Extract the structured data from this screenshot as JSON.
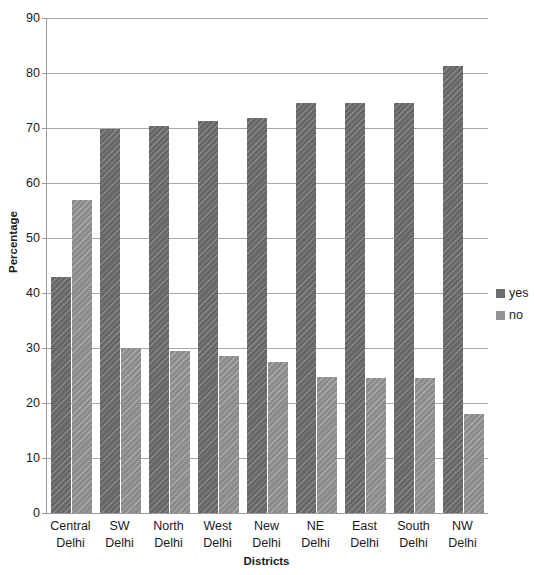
{
  "chart_data": {
    "type": "bar",
    "title": "",
    "xlabel": "Districts",
    "ylabel": "Percentage",
    "categories": [
      "Central Delhi",
      "SW Delhi",
      "North Delhi",
      "West Delhi",
      "New Delhi",
      "NE Delhi",
      "East Delhi",
      "South Delhi",
      "NW Delhi"
    ],
    "category_lines": [
      [
        "Central",
        "Delhi"
      ],
      [
        "SW Delhi",
        ""
      ],
      [
        "North",
        "Delhi"
      ],
      [
        "West",
        "Delhi"
      ],
      [
        "New",
        "Delhi"
      ],
      [
        "NE Delhi",
        ""
      ],
      [
        "East",
        "Delhi"
      ],
      [
        "South",
        "Delhi"
      ],
      [
        "NW Delhi",
        ""
      ]
    ],
    "series": [
      {
        "name": "yes",
        "color": "#6f6f6f",
        "values": [
          43.0,
          69.8,
          70.4,
          71.2,
          71.9,
          74.6,
          74.6,
          74.5,
          81.2
        ]
      },
      {
        "name": "no",
        "color": "#949494",
        "values": [
          57.0,
          30.0,
          29.4,
          28.5,
          27.5,
          24.7,
          24.5,
          24.6,
          18.0
        ]
      }
    ],
    "ylim": [
      0,
      90
    ],
    "ytick_step": 10,
    "yticks": [
      0,
      10,
      20,
      30,
      40,
      50,
      60,
      70,
      80,
      90
    ],
    "grid": true,
    "grid_axis": "y",
    "legend_position": "right"
  },
  "legend": {
    "entries": [
      {
        "label": "yes",
        "color": "#6f6f6f"
      },
      {
        "label": "no",
        "color": "#949494"
      }
    ]
  },
  "axes": {
    "y_title": "Percentage",
    "x_title": "Districts"
  }
}
